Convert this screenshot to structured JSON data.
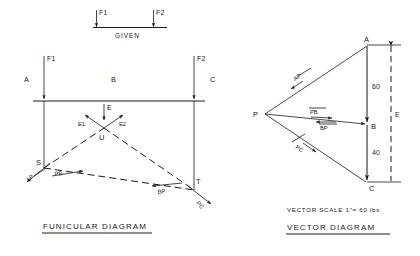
{
  "figure": {
    "given": {
      "caption": "GIVEN",
      "force_left": "F1",
      "force_right": "F2"
    },
    "funicular": {
      "caption": "FUNICULAR    DIAGRAM",
      "regions": {
        "left": "A",
        "middle": "B",
        "right": "C"
      },
      "forces": {
        "left": "F1",
        "right": "F2"
      },
      "resultant": "E",
      "components": {
        "left": "E1",
        "right": "E2"
      },
      "points": {
        "apex": "U",
        "left_base": "S",
        "right_base": "T"
      },
      "strings": {
        "ap": "AP",
        "pb": "PB",
        "bp": "BP",
        "pc": "PC"
      }
    },
    "vector": {
      "caption": "VECTOR    DIAGRAM",
      "scale_note": "VECTOR  SCALE   1\"= 60 lbs",
      "points": {
        "top": "A",
        "middle": "B",
        "bottom": "C",
        "pole": "P"
      },
      "segments": {
        "ab": "60",
        "bc": "40"
      },
      "total": "E",
      "rays": {
        "ap": "AP",
        "pb": "PB",
        "bp": "BP",
        "pc": "PC"
      }
    }
  }
}
